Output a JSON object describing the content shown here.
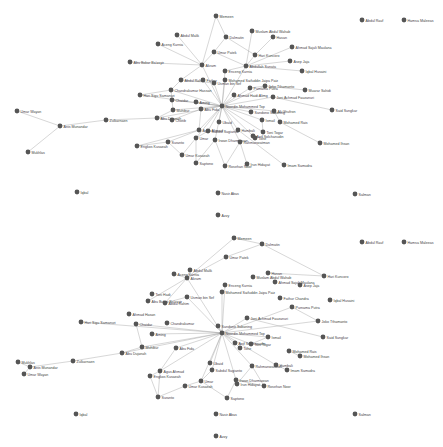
{
  "graph_style": {
    "node_color": "#555555",
    "edge_color": "#9a9a9a",
    "background": "#ffffff",
    "node_radius": 2.4
  },
  "panels": [
    {
      "id": "top",
      "layout": "force-compact",
      "nodes": [
        {
          "id": "Memeen",
          "x": 216,
          "y": 16
        },
        {
          "id": "Abdul Malik",
          "x": 177,
          "y": 35
        },
        {
          "id": "Dulmatin",
          "x": 226,
          "y": 37
        },
        {
          "id": "Muslam Abdul Wahab",
          "x": 252,
          "y": 31
        },
        {
          "id": "Hasan",
          "x": 273,
          "y": 37
        },
        {
          "id": "Aceng Kurnia",
          "x": 158,
          "y": 44
        },
        {
          "id": "Umar Patek",
          "x": 214,
          "y": 52
        },
        {
          "id": "Ahmad Sajuli Maulana",
          "x": 292,
          "y": 47
        },
        {
          "id": "Hari Kuncoro",
          "x": 255,
          "y": 55
        },
        {
          "id": "Abdullah Sunata",
          "x": 246,
          "y": 66
        },
        {
          "id": "Abu Bakar Ba'asyir",
          "x": 130,
          "y": 62
        },
        {
          "id": "Asep Jaja",
          "x": 290,
          "y": 61
        },
        {
          "id": "Iqbal Husaini",
          "x": 302,
          "y": 71
        },
        {
          "id": "Akram",
          "x": 202,
          "y": 65
        },
        {
          "id": "Enceng Kurnia",
          "x": 225,
          "y": 71
        },
        {
          "id": "Mohamed Saifuddin Jaipa Paiz",
          "x": 225,
          "y": 80
        },
        {
          "id": "Abdul Rahim",
          "x": 181,
          "y": 80
        },
        {
          "id": "Fathur",
          "x": 203,
          "y": 80
        },
        {
          "id": "Usman bin Sef",
          "x": 214,
          "y": 83
        },
        {
          "id": "Purnama Putra",
          "x": 250,
          "y": 88
        },
        {
          "id": "Joko Tthamanto",
          "x": 265,
          "y": 86
        },
        {
          "id": "Muarar Sahidi",
          "x": 305,
          "y": 90
        },
        {
          "id": "Chandrakumar Hassan",
          "x": 171,
          "y": 90
        },
        {
          "id": "Hari Sigu Samanuri",
          "x": 140,
          "y": 95
        },
        {
          "id": "Ahmad Haidi Alimg",
          "x": 234,
          "y": 95
        },
        {
          "id": "Joni Achmad Fauzanuri",
          "x": 273,
          "y": 97
        },
        {
          "id": "Chaidar",
          "x": 172,
          "y": 100
        },
        {
          "id": "Aming",
          "x": 196,
          "y": 102
        },
        {
          "id": "Noordin Mohammed Top",
          "x": 222,
          "y": 106
        },
        {
          "id": "Said Sungkar",
          "x": 332,
          "y": 110
        },
        {
          "id": "Muhibur",
          "x": 173,
          "y": 110
        },
        {
          "id": "Abu Fida",
          "x": 201,
          "y": 109
        },
        {
          "id": "Sandono Sabaning",
          "x": 251,
          "y": 112
        },
        {
          "id": "Ali Ghufron",
          "x": 274,
          "y": 111
        },
        {
          "id": "Abu Dujanah",
          "x": 157,
          "y": 118
        },
        {
          "id": "Chotib",
          "x": 172,
          "y": 120
        },
        {
          "id": "Ubaid",
          "x": 219,
          "y": 122
        },
        {
          "id": "Ismail",
          "x": 262,
          "y": 120
        },
        {
          "id": "Mohamed Rais",
          "x": 280,
          "y": 122
        },
        {
          "id": "Agus Ahmad",
          "x": 199,
          "y": 130
        },
        {
          "id": "Sabdul Sugianto",
          "x": 208,
          "y": 131
        },
        {
          "id": "Hambali",
          "x": 238,
          "y": 130
        },
        {
          "id": "Toni Togar",
          "x": 263,
          "y": 132
        },
        {
          "id": "Anif Solchanudin",
          "x": 253,
          "y": 136
        },
        {
          "id": "Tohe",
          "x": 255,
          "y": 138
        },
        {
          "id": "Umar",
          "x": 196,
          "y": 138
        },
        {
          "id": "Irwan Dharmawan",
          "x": 215,
          "y": 140
        },
        {
          "id": "Rahmanwatman",
          "x": 240,
          "y": 142
        },
        {
          "id": "Mohamed Ihsan",
          "x": 320,
          "y": 143
        },
        {
          "id": "Suranto",
          "x": 168,
          "y": 142
        },
        {
          "id": "Engkos Kusaeah",
          "x": 137,
          "y": 146
        },
        {
          "id": "Umar Kusaeah",
          "x": 182,
          "y": 155
        },
        {
          "id": "Saptono",
          "x": 196,
          "y": 163
        },
        {
          "id": "Imam Samudra",
          "x": 284,
          "y": 165
        },
        {
          "id": "Rosehan Noor",
          "x": 225,
          "y": 166
        },
        {
          "id": "Irun Hidayat",
          "x": 247,
          "y": 164
        },
        {
          "id": "Umar Wayan",
          "x": 17,
          "y": 111
        },
        {
          "id": "Anis Munandar",
          "x": 60,
          "y": 126
        },
        {
          "id": "Zulkarnaen",
          "x": 106,
          "y": 120
        },
        {
          "id": "Mukhlas",
          "x": 28,
          "y": 152
        },
        {
          "id": "Iqbal",
          "x": 77,
          "y": 192
        },
        {
          "id": "Nasir Abas",
          "x": 218,
          "y": 193
        },
        {
          "id": "Salman",
          "x": 355,
          "y": 194
        },
        {
          "id": "Azzy",
          "x": 218,
          "y": 215
        },
        {
          "id": "Abdul Rauf",
          "x": 362,
          "y": 20
        },
        {
          "id": "Hamsa Maleeas",
          "x": 404,
          "y": 20
        }
      ]
    },
    {
      "id": "bottom",
      "layout": "spread",
      "nodes": [
        {
          "id": "Memeen",
          "x": 234,
          "y": 238
        },
        {
          "id": "Dulmatin",
          "x": 262,
          "y": 244
        },
        {
          "id": "Umar Patek",
          "x": 226,
          "y": 257
        },
        {
          "id": "Abdul Rauf",
          "x": 362,
          "y": 242
        },
        {
          "id": "Hamsa Maleeas",
          "x": 404,
          "y": 242
        },
        {
          "id": "Abdul Malik",
          "x": 190,
          "y": 270
        },
        {
          "id": "Aceng Kurnia",
          "x": 174,
          "y": 274
        },
        {
          "id": "Akram",
          "x": 187,
          "y": 278
        },
        {
          "id": "Muslam Abdul Wahab",
          "x": 253,
          "y": 277
        },
        {
          "id": "Hasan",
          "x": 268,
          "y": 273
        },
        {
          "id": "Ahmad Sajuli Maulana",
          "x": 275,
          "y": 282
        },
        {
          "id": "Asep Jaja",
          "x": 300,
          "y": 285
        },
        {
          "id": "Hari Kuncoro",
          "x": 324,
          "y": 276
        },
        {
          "id": "Enceng Kurnia",
          "x": 225,
          "y": 285
        },
        {
          "id": "Mohamed Saifuddin Jaipa Paiz",
          "x": 222,
          "y": 292
        },
        {
          "id": "Iqbal Husaini",
          "x": 330,
          "y": 300
        },
        {
          "id": "Toni Hadi",
          "x": 152,
          "y": 294
        },
        {
          "id": "Usman bin Sef",
          "x": 187,
          "y": 297
        },
        {
          "id": "Fathur Chandra",
          "x": 280,
          "y": 298
        },
        {
          "id": "Abu Bakar Ba'asyir",
          "x": 148,
          "y": 301
        },
        {
          "id": "Abdul Rahim",
          "x": 165,
          "y": 303
        },
        {
          "id": "Purnama Putra",
          "x": 292,
          "y": 307
        },
        {
          "id": "Hari Sigu Samanuri",
          "x": 81,
          "y": 322
        },
        {
          "id": "Ahmad Hasan",
          "x": 129,
          "y": 314
        },
        {
          "id": "Chandrakumar",
          "x": 167,
          "y": 323
        },
        {
          "id": "Chaidar",
          "x": 136,
          "y": 324
        },
        {
          "id": "Sandono Sabaning",
          "x": 218,
          "y": 326
        },
        {
          "id": "Aming",
          "x": 152,
          "y": 334
        },
        {
          "id": "Joni Achmad Fauzanuri",
          "x": 247,
          "y": 318
        },
        {
          "id": "Joko Tthamanto",
          "x": 318,
          "y": 321
        },
        {
          "id": "Noordin Mohammed Top",
          "x": 222,
          "y": 333
        },
        {
          "id": "Ismail",
          "x": 268,
          "y": 337
        },
        {
          "id": "Said Sungkar",
          "x": 323,
          "y": 337
        },
        {
          "id": "Muhibur",
          "x": 142,
          "y": 347
        },
        {
          "id": "Abu Fida",
          "x": 176,
          "y": 348
        },
        {
          "id": "Anif Solchanudin",
          "x": 235,
          "y": 343
        },
        {
          "id": "Toni Togar",
          "x": 251,
          "y": 344
        },
        {
          "id": "Tohe",
          "x": 240,
          "y": 348
        },
        {
          "id": "Mohamed Rais",
          "x": 289,
          "y": 351
        },
        {
          "id": "Mohamed Ihsan",
          "x": 300,
          "y": 356
        },
        {
          "id": "Abu Dujanah",
          "x": 122,
          "y": 353
        },
        {
          "id": "Zulkarnaen",
          "x": 73,
          "y": 361
        },
        {
          "id": "Mukhlas",
          "x": 18,
          "y": 362
        },
        {
          "id": "Anis Munandar",
          "x": 30,
          "y": 367
        },
        {
          "id": "Umar Wayan",
          "x": 24,
          "y": 374
        },
        {
          "id": "Ubaid",
          "x": 210,
          "y": 363
        },
        {
          "id": "Rahmanwatman",
          "x": 252,
          "y": 366
        },
        {
          "id": "Hambali",
          "x": 276,
          "y": 365
        },
        {
          "id": "Imam Samudra",
          "x": 287,
          "y": 370
        },
        {
          "id": "Agus Ahmad",
          "x": 160,
          "y": 371
        },
        {
          "id": "Engkos Kusaeah",
          "x": 150,
          "y": 376
        },
        {
          "id": "Sabdul Sugianto",
          "x": 212,
          "y": 370
        },
        {
          "id": "Umar",
          "x": 201,
          "y": 381
        },
        {
          "id": "Irwan Dharmawan",
          "x": 236,
          "y": 380
        },
        {
          "id": "Suranto",
          "x": 158,
          "y": 397
        },
        {
          "id": "Umar Kusaeah",
          "x": 185,
          "y": 386
        },
        {
          "id": "Irun Hidayat",
          "x": 237,
          "y": 384
        },
        {
          "id": "Rosehan Noor",
          "x": 264,
          "y": 386
        },
        {
          "id": "Saptono",
          "x": 227,
          "y": 398
        },
        {
          "id": "Iqbal",
          "x": 76,
          "y": 414
        },
        {
          "id": "Nasir Abas",
          "x": 216,
          "y": 414
        },
        {
          "id": "Salman",
          "x": 355,
          "y": 414
        },
        {
          "id": "Azzy",
          "x": 216,
          "y": 436
        }
      ]
    }
  ],
  "edges": [
    [
      "Noordin Mohammed Top",
      "Abdullah Sunata"
    ],
    [
      "Noordin Mohammed Top",
      "Enceng Kurnia"
    ],
    [
      "Noordin Mohammed Top",
      "Mohamed Saifuddin Jaipa Paiz"
    ],
    [
      "Noordin Mohammed Top",
      "Akram"
    ],
    [
      "Noordin Mohammed Top",
      "Usman bin Sef"
    ],
    [
      "Noordin Mohammed Top",
      "Fathur"
    ],
    [
      "Noordin Mohammed Top",
      "Ahmad Haidi Alimg"
    ],
    [
      "Noordin Mohammed Top",
      "Purnama Putra"
    ],
    [
      "Noordin Mohammed Top",
      "Joko Tthamanto"
    ],
    [
      "Noordin Mohammed Top",
      "Aming"
    ],
    [
      "Noordin Mohammed Top",
      "Abu Fida"
    ],
    [
      "Noordin Mohammed Top",
      "Chaidar"
    ],
    [
      "Noordin Mohammed Top",
      "Chandrakumar Hassan"
    ],
    [
      "Noordin Mohammed Top",
      "Muhibur"
    ],
    [
      "Noordin Mohammed Top",
      "Sandono Sabaning"
    ],
    [
      "Noordin Mohammed Top",
      "Ali Ghufron"
    ],
    [
      "Noordin Mohammed Top",
      "Ismail"
    ],
    [
      "Noordin Mohammed Top",
      "Ubaid"
    ],
    [
      "Noordin Mohammed Top",
      "Hambali"
    ],
    [
      "Noordin Mohammed Top",
      "Anif Solchanudin"
    ],
    [
      "Noordin Mohammed Top",
      "Toni Togar"
    ],
    [
      "Noordin Mohammed Top",
      "Agus Ahmad"
    ],
    [
      "Noordin Mohammed Top",
      "Sabdul Sugianto"
    ],
    [
      "Noordin Mohammed Top",
      "Irwan Dharmawan"
    ],
    [
      "Noordin Mohammed Top",
      "Abu Dujanah"
    ],
    [
      "Noordin Mohammed Top",
      "Joni Achmad Fauzanuri"
    ],
    [
      "Noordin Mohammed Top",
      "Umar"
    ],
    [
      "Noordin Mohammed Top",
      "Rahmanwatman"
    ],
    [
      "Noordin Mohammed Top",
      "Hari Sigu Samanuri"
    ],
    [
      "Abdullah Sunata",
      "Hari Kuncoro"
    ],
    [
      "Abdullah Sunata",
      "Asep Jaja"
    ],
    [
      "Abdullah Sunata",
      "Ahmad Sajuli Maulana"
    ],
    [
      "Abdullah Sunata",
      "Muslam Abdul Wahab"
    ],
    [
      "Abdullah Sunata",
      "Iqbal Husaini"
    ],
    [
      "Abdullah Sunata",
      "Enceng Kurnia"
    ],
    [
      "Abdullah Sunata",
      "Umar Patek"
    ],
    [
      "Hari Kuncoro",
      "Dulmatin"
    ],
    [
      "Hari Kuncoro",
      "Hasan"
    ],
    [
      "Dulmatin",
      "Umar Patek"
    ],
    [
      "Dulmatin",
      "Memeen"
    ],
    [
      "Umar Patek",
      "Akram"
    ],
    [
      "Memeen",
      "Akram"
    ],
    [
      "Akram",
      "Abdul Malik"
    ],
    [
      "Akram",
      "Aceng Kurnia"
    ],
    [
      "Akram",
      "Abu Bakar Ba'asyir"
    ],
    [
      "Akram",
      "Abdul Rahim"
    ],
    [
      "Abdul Rahim",
      "Usman bin Sef"
    ],
    [
      "Abdul Rahim",
      "Chandrakumar Hassan"
    ],
    [
      "Chandrakumar Hassan",
      "Hari Sigu Samanuri"
    ],
    [
      "Chandrakumar Hassan",
      "Chaidar"
    ],
    [
      "Chaidar",
      "Muhibur"
    ],
    [
      "Muhibur",
      "Abu Dujanah"
    ],
    [
      "Abu Dujanah",
      "Chotib"
    ],
    [
      "Abu Dujanah",
      "Zulkarnaen"
    ],
    [
      "Zulkarnaen",
      "Anis Munandar"
    ],
    [
      "Anis Munandar",
      "Umar Wayan"
    ],
    [
      "Anis Munandar",
      "Mukhlas"
    ],
    [
      "Abu Fida",
      "Chotib"
    ],
    [
      "Abu Fida",
      "Agus Ahmad"
    ],
    [
      "Agus Ahmad",
      "Engkos Kusaeah"
    ],
    [
      "Agus Ahmad",
      "Suranto"
    ],
    [
      "Sabdul Sugianto",
      "Umar"
    ],
    [
      "Umar",
      "Umar Kusaeah"
    ],
    [
      "Umar",
      "Saptono"
    ],
    [
      "Irwan Dharmawan",
      "Saptono"
    ],
    [
      "Irwan Dharmawan",
      "Rosehan Noor"
    ],
    [
      "Rahmanwatman",
      "Rosehan Noor"
    ],
    [
      "Rahmanwatman",
      "Irun Hidayat"
    ],
    [
      "Hambali",
      "Imam Samudra"
    ],
    [
      "Ali Ghufron",
      "Mohamed Rais"
    ],
    [
      "Mohamed Rais",
      "Mohamed Ihsan"
    ],
    [
      "Joni Achmad Fauzanuri",
      "Said Sungkar"
    ],
    [
      "Joko Tthamanto",
      "Muarar Sahidi"
    ],
    [
      "Purnama Putra",
      "Joko Tthamanto"
    ],
    [
      "Ismail",
      "Toni Togar"
    ],
    [
      "Anif Solchanudin",
      "Tohe"
    ],
    [
      "Suranto",
      "Umar Kusaeah"
    ],
    [
      "Engkos Kusaeah",
      "Suranto"
    ]
  ]
}
